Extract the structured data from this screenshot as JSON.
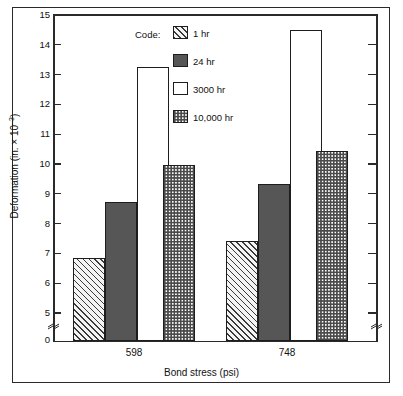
{
  "chart_data": {
    "type": "bar",
    "title": "",
    "xlabel": "Bond stress (psi)",
    "ylabel": "Deformation (in. × 10⁻³)",
    "categories": [
      "598",
      "748"
    ],
    "series": [
      {
        "name": "1 hr",
        "values": [
          6.85,
          7.4
        ],
        "pattern": "diagonal-hatch"
      },
      {
        "name": "24 hr",
        "values": [
          8.73,
          9.33
        ],
        "pattern": "solid-dark"
      },
      {
        "name": "3000 hr",
        "values": [
          13.25,
          14.5
        ],
        "pattern": "white"
      },
      {
        "name": "10,000 hr",
        "values": [
          9.95,
          10.45
        ],
        "pattern": "checkerboard"
      }
    ],
    "ylim": [
      5,
      15
    ],
    "y_ticks": [
      "5",
      "6",
      "7",
      "8",
      "9",
      "10",
      "11",
      "12",
      "13",
      "14",
      "15"
    ],
    "y_axis_break": true,
    "y_zero_label": "0",
    "grid": false,
    "legend_position": "top-center",
    "legend_title": "Code:"
  },
  "axes": {
    "y_title_main": "Deformation (in. × 10",
    "y_title_exp": "–3",
    "y_title_close": ")",
    "x_title": "Bond stress (psi)"
  },
  "legend": {
    "title": "Code:",
    "entries": [
      {
        "label": "1 hr"
      },
      {
        "label": "24 hr"
      },
      {
        "label": "3000 hr"
      },
      {
        "label": "10,000 hr"
      }
    ]
  },
  "colors": {
    "axis": "#2a2a2a",
    "bar_outline": "#1d1d1d",
    "solid_dark": "#565656",
    "hatch_bg": "#f2f2f2",
    "background": "#ffffff"
  }
}
